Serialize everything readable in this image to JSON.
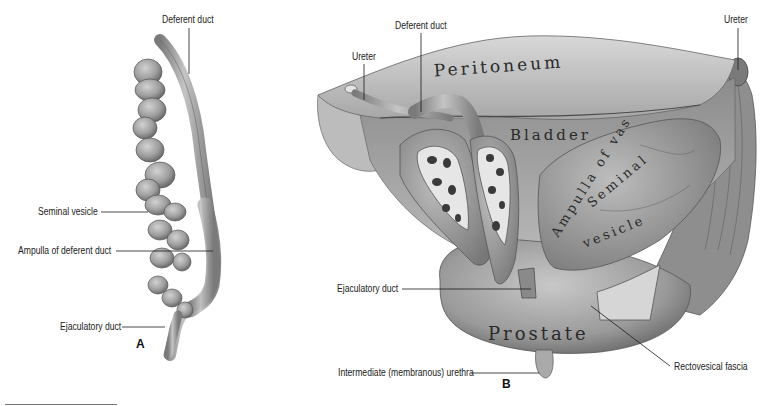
{
  "figure": {
    "panels": [
      {
        "id": "A",
        "letter": "A",
        "labels": {
          "deferent_duct": "Deferent duct",
          "seminal_vesicle": "Seminal vesicle",
          "ampulla_of_deferent_duct": "Ampulla of deferent duct",
          "ejaculatory_duct": "Ejaculatory duct"
        }
      },
      {
        "id": "B",
        "letter": "B",
        "labels": {
          "ureter_left": "Ureter",
          "deferent_duct": "Deferent duct",
          "ureter_right": "Ureter",
          "ejaculatory_duct": "Ejaculatory duct",
          "intermediate_urethra": "Intermediate (membranous) urethra",
          "rectovesical_fascia": "Rectovesical fascia"
        },
        "organ_labels": {
          "peritoneum": "Peritoneum",
          "bladder": "Bladder",
          "ampulla_of_vas": "Ampulla of vas",
          "seminal": "Seminal",
          "vesicle": "vesicle",
          "prostate": "Prostate"
        }
      }
    ],
    "colors": {
      "tissue_light": "#c9c9c9",
      "tissue_mid": "#9a9a9a",
      "tissue_dark": "#5e5e5e",
      "leader_line": "#1a1a1a",
      "label_text": "#222222"
    }
  }
}
